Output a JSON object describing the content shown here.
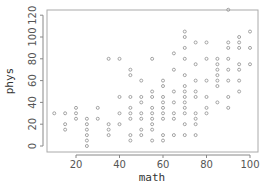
{
  "chart_data": {
    "type": "scatter",
    "title": "",
    "xlabel": "math",
    "ylabel": "phys",
    "xlim": [
      8,
      104
    ],
    "ylim": [
      -5,
      130
    ],
    "xticks": [
      20,
      40,
      60,
      80,
      100
    ],
    "yticks": [
      0,
      20,
      40,
      60,
      80,
      100,
      120
    ],
    "grid": false,
    "legend": null,
    "marker": "open-circle",
    "marker_color": "#999999",
    "points": [
      [
        10,
        30
      ],
      [
        15,
        30
      ],
      [
        15,
        20
      ],
      [
        15,
        15
      ],
      [
        20,
        35
      ],
      [
        20,
        30
      ],
      [
        20,
        25
      ],
      [
        25,
        25
      ],
      [
        25,
        20
      ],
      [
        25,
        15
      ],
      [
        25,
        10
      ],
      [
        25,
        5
      ],
      [
        25,
        0
      ],
      [
        30,
        35
      ],
      [
        30,
        25
      ],
      [
        35,
        80
      ],
      [
        35,
        20
      ],
      [
        35,
        15
      ],
      [
        35,
        10
      ],
      [
        40,
        80
      ],
      [
        40,
        45
      ],
      [
        40,
        30
      ],
      [
        40,
        20
      ],
      [
        45,
        70
      ],
      [
        45,
        65
      ],
      [
        45,
        45
      ],
      [
        45,
        35
      ],
      [
        45,
        30
      ],
      [
        45,
        25
      ],
      [
        45,
        10
      ],
      [
        45,
        5
      ],
      [
        50,
        60
      ],
      [
        50,
        45
      ],
      [
        50,
        40
      ],
      [
        50,
        30
      ],
      [
        50,
        25
      ],
      [
        50,
        15
      ],
      [
        50,
        10
      ],
      [
        55,
        80
      ],
      [
        55,
        50
      ],
      [
        55,
        45
      ],
      [
        55,
        35
      ],
      [
        55,
        30
      ],
      [
        55,
        25
      ],
      [
        55,
        20
      ],
      [
        55,
        15
      ],
      [
        55,
        5
      ],
      [
        60,
        60
      ],
      [
        60,
        55
      ],
      [
        60,
        45
      ],
      [
        60,
        40
      ],
      [
        60,
        35
      ],
      [
        60,
        30
      ],
      [
        60,
        25
      ],
      [
        60,
        10
      ],
      [
        60,
        5
      ],
      [
        65,
        85
      ],
      [
        65,
        70
      ],
      [
        65,
        50
      ],
      [
        65,
        40
      ],
      [
        65,
        30
      ],
      [
        65,
        25
      ],
      [
        65,
        10
      ],
      [
        70,
        105
      ],
      [
        70,
        100
      ],
      [
        70,
        90
      ],
      [
        70,
        80
      ],
      [
        70,
        65
      ],
      [
        70,
        55
      ],
      [
        70,
        50
      ],
      [
        70,
        45
      ],
      [
        70,
        40
      ],
      [
        70,
        35
      ],
      [
        70,
        30
      ],
      [
        70,
        20
      ],
      [
        70,
        10
      ],
      [
        75,
        95
      ],
      [
        75,
        75
      ],
      [
        75,
        60
      ],
      [
        75,
        50
      ],
      [
        75,
        45
      ],
      [
        75,
        30
      ],
      [
        75,
        25
      ],
      [
        75,
        20
      ],
      [
        75,
        10
      ],
      [
        80,
        95
      ],
      [
        80,
        80
      ],
      [
        80,
        60
      ],
      [
        80,
        45
      ],
      [
        80,
        35
      ],
      [
        80,
        30
      ],
      [
        85,
        80
      ],
      [
        85,
        75
      ],
      [
        85,
        70
      ],
      [
        85,
        65
      ],
      [
        85,
        60
      ],
      [
        85,
        55
      ],
      [
        85,
        40
      ],
      [
        90,
        125
      ],
      [
        90,
        95
      ],
      [
        90,
        90
      ],
      [
        90,
        80
      ],
      [
        90,
        70
      ],
      [
        90,
        60
      ],
      [
        90,
        45
      ],
      [
        90,
        35
      ],
      [
        95,
        100
      ],
      [
        95,
        95
      ],
      [
        95,
        90
      ],
      [
        95,
        75
      ],
      [
        95,
        70
      ],
      [
        95,
        60
      ],
      [
        95,
        50
      ],
      [
        100,
        105
      ],
      [
        100,
        90
      ],
      [
        100,
        75
      ]
    ]
  }
}
